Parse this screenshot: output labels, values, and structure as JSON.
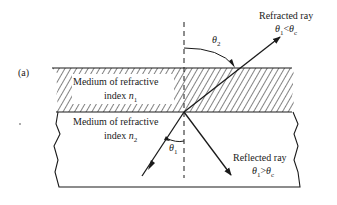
{
  "figure": {
    "panel_label": "(a)",
    "medium1": {
      "line1": "Medium of refractive",
      "line2": "index",
      "symbol": "n",
      "subscript": "1"
    },
    "medium2": {
      "line1": "Medium of refractive",
      "line2": "index",
      "symbol": "n",
      "subscript": "2"
    },
    "refracted": {
      "title": "Refracted ray",
      "condition_lhs": "θ",
      "lhs_sub": "1",
      "op": "<",
      "condition_rhs": "θ",
      "rhs_sub": "c"
    },
    "reflected": {
      "title": "Reflected ray",
      "condition_lhs": "θ",
      "lhs_sub": "1",
      "op": ">",
      "condition_rhs": "θ",
      "rhs_sub": "c"
    },
    "angle_incident": {
      "symbol": "θ",
      "sub": "1"
    },
    "angle_refracted": {
      "symbol": "θ",
      "sub": "2"
    },
    "stroke_color": "#1a1a1a"
  }
}
